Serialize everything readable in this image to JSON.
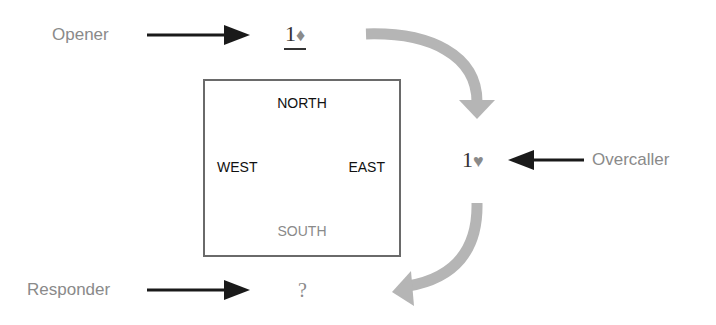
{
  "diagram": {
    "type": "bridge-bidding-sequence",
    "roles": {
      "opener": "Opener",
      "overcaller": "Overcaller",
      "responder": "Responder"
    },
    "bids": {
      "opener_level": "1",
      "opener_suit": "♦",
      "overcaller_level": "1",
      "overcaller_suit": "♥",
      "responder": "?"
    },
    "table": {
      "north": "NORTH",
      "south": "SOUTH",
      "east": "EAST",
      "west": "WEST"
    },
    "colors": {
      "role_text": "#8a8a8a",
      "pointer_arrow": "#1a1a1a",
      "flow_arrow": "#b5b5b5",
      "box_border": "#6a6a6a",
      "south_text": "#8a8a8a",
      "direction_text": "#111111"
    }
  }
}
